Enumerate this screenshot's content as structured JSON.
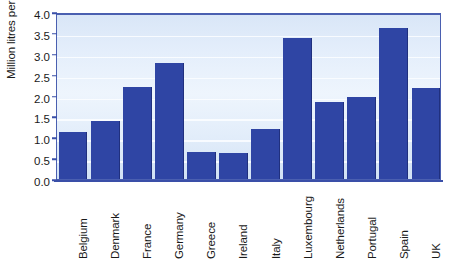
{
  "chart_data": {
    "type": "bar",
    "title": "",
    "xlabel": "",
    "ylabel": "Million litres per annum",
    "ylim": [
      0.0,
      4.0
    ],
    "ytick_labels": [
      "4.0",
      "3.5",
      "3.0",
      "2.5",
      "2.0",
      "1.5",
      "1.0",
      "0.5",
      "0.0"
    ],
    "yticks": [
      4.0,
      3.5,
      3.0,
      2.5,
      2.0,
      1.5,
      1.0,
      0.5,
      0.0
    ],
    "grid": true,
    "legend": "none",
    "categories": [
      "Belgium",
      "Denmark",
      "France",
      "Germany",
      "Greece",
      "Ireland",
      "Italy",
      "Luxembourg",
      "Netherlands",
      "Portugal",
      "Spain",
      "UK"
    ],
    "values": [
      1.12,
      1.4,
      2.2,
      2.77,
      0.65,
      0.62,
      1.2,
      3.38,
      1.85,
      1.96,
      3.62,
      2.18
    ],
    "bar_color": "#2f45a4",
    "plot_background_color": "#e4eefb",
    "axis_color": "#4a5fb0"
  },
  "clipped_top_text": ""
}
